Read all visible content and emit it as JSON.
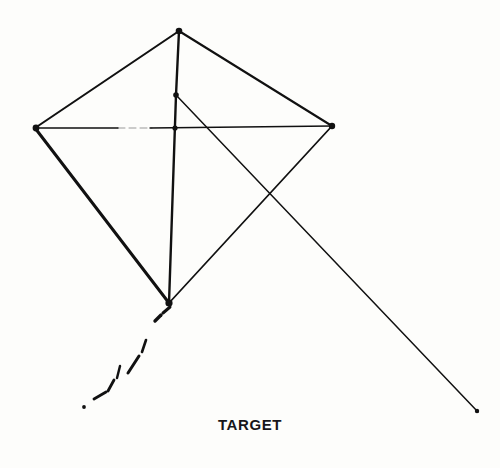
{
  "figure": {
    "caption": "TARGET",
    "background_color": "#fdfdfb",
    "ink_color": "#111111"
  },
  "chart_data": {
    "type": "diagram",
    "title": "TARGET",
    "xlabel": "",
    "ylabel": "",
    "coordinate_space": {
      "width": 500,
      "height": 468,
      "origin": "top-left"
    },
    "vertices": [
      {
        "name": "apex",
        "x": 179,
        "y": 31
      },
      {
        "name": "left-wingtip",
        "x": 35,
        "y": 128
      },
      {
        "name": "right-wingtip",
        "x": 332,
        "y": 126
      },
      {
        "name": "bottom-tip",
        "x": 169,
        "y": 303
      },
      {
        "name": "bridle-node",
        "x": 176,
        "y": 95
      },
      {
        "name": "spar-crossing",
        "x": 175,
        "y": 128
      },
      {
        "name": "line-crossing",
        "x": 271,
        "y": 193
      },
      {
        "name": "flying-line-end",
        "x": 478,
        "y": 412
      }
    ],
    "edges": [
      {
        "name": "apex-to-left-wingtip",
        "from": "apex",
        "to": "left-wingtip",
        "weight": 2.1
      },
      {
        "name": "apex-to-right-wingtip",
        "from": "apex",
        "to": "right-wingtip",
        "weight": 2.1
      },
      {
        "name": "left-wingtip-to-bottom-tip",
        "from": "left-wingtip",
        "to": "bottom-tip",
        "weight": 3.0
      },
      {
        "name": "right-wingtip-to-bottom-tip",
        "from": "right-wingtip",
        "to": "bottom-tip",
        "weight": 1.8
      },
      {
        "name": "vertical-spar",
        "from": "apex",
        "to": "bottom-tip",
        "weight": 2.4
      },
      {
        "name": "horizontal-spar",
        "from": "left-wingtip",
        "to": "right-wingtip",
        "weight": 1.3
      },
      {
        "name": "flying-line",
        "from": "bridle-node",
        "to": "flying-line-end",
        "weight": 1.5
      }
    ],
    "tail": {
      "name": "kite-tail",
      "style": "dashed-broken",
      "from": "bottom-tip",
      "direction": "down-left",
      "segments": [
        {
          "x1": 170,
          "y1": 307,
          "x2": 163,
          "y2": 313
        },
        {
          "x1": 161,
          "y1": 315,
          "x2": 155,
          "y2": 321
        },
        {
          "x1": 146,
          "y1": 340,
          "x2": 142,
          "y2": 352
        },
        {
          "x1": 139,
          "y1": 356,
          "x2": 128,
          "y2": 373
        },
        {
          "x1": 120,
          "y1": 366,
          "x2": 117,
          "y2": 378
        },
        {
          "x1": 114,
          "y1": 380,
          "x2": 108,
          "y2": 391
        },
        {
          "x1": 106,
          "y1": 392,
          "x2": 94,
          "y2": 399
        },
        {
          "x1": 93,
          "y1": 400,
          "x2": 91,
          "y2": 401
        }
      ],
      "dots": [
        {
          "x": 84,
          "y": 407,
          "r": 1.9
        }
      ]
    },
    "nodes": [
      {
        "name": "apex-node",
        "x": 179,
        "y": 31,
        "r": 3.3
      },
      {
        "name": "left-wingtip-node",
        "x": 36,
        "y": 128,
        "r": 3.4
      },
      {
        "name": "right-wingtip-node",
        "x": 332,
        "y": 126,
        "r": 3.2
      },
      {
        "name": "bottom-tip-node",
        "x": 169,
        "y": 303,
        "r": 3.6
      },
      {
        "name": "bridle-node-marker",
        "x": 176,
        "y": 95,
        "r": 2.8
      },
      {
        "name": "spar-crossing-node",
        "x": 175,
        "y": 128,
        "r": 2.6
      },
      {
        "name": "flying-line-end-node",
        "x": 477,
        "y": 411,
        "r": 2.2
      }
    ]
  }
}
